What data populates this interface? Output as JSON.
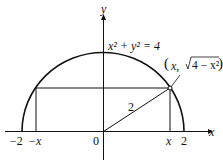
{
  "diagram": {
    "equation": "x² + y² = 4",
    "point_label_open": "(",
    "point_label_x": "x,",
    "point_label_rad": "4 − x²",
    "point_label_close": ")",
    "radius_label": "2",
    "axis_x_label": "x",
    "axis_y_label": "y",
    "ticks": {
      "neg2": "−2",
      "negx": "−x",
      "zero": "0",
      "x": "x",
      "two": "2"
    }
  }
}
